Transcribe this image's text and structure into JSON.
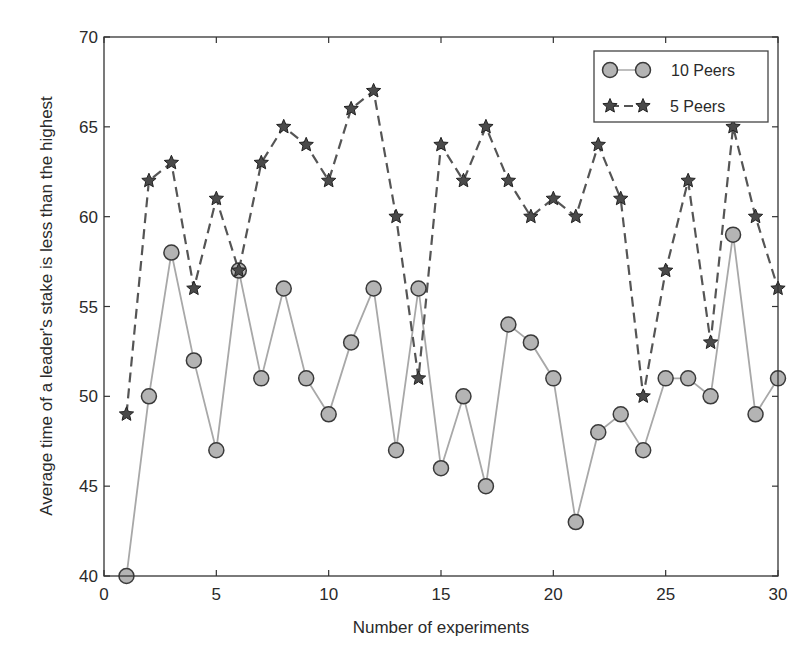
{
  "chart_data": {
    "type": "line",
    "title": "",
    "xlabel": "Number of experiments",
    "ylabel": "Average time of a leader's stake is less than the highest",
    "xlim": [
      0,
      30
    ],
    "ylim": [
      40,
      70
    ],
    "xticks": [
      0,
      5,
      10,
      15,
      20,
      25,
      30
    ],
    "yticks": [
      40,
      45,
      50,
      55,
      60,
      65,
      70
    ],
    "grid": false,
    "legend_position": "upper right",
    "x": [
      1,
      2,
      3,
      4,
      5,
      6,
      7,
      8,
      9,
      10,
      11,
      12,
      13,
      14,
      15,
      16,
      17,
      18,
      19,
      20,
      21,
      22,
      23,
      24,
      25,
      26,
      27,
      28,
      29,
      30
    ],
    "series": [
      {
        "name": "10 Peers",
        "marker": "circle",
        "line_style": "solid",
        "line_color": "#a8a8a8",
        "marker_fill": "#b4b4b4",
        "marker_edge": "#3a3a3a",
        "values": [
          40,
          50,
          58,
          52,
          47,
          57,
          51,
          56,
          51,
          49,
          53,
          56,
          47,
          56,
          46,
          50,
          45,
          54,
          53,
          51,
          43,
          48,
          49,
          47,
          51,
          51,
          50,
          59,
          49,
          51
        ]
      },
      {
        "name": "5 Peers",
        "marker": "star",
        "line_style": "dashed",
        "line_color": "#555555",
        "marker_fill": "#4a4a4a",
        "marker_edge": "#222222",
        "values": [
          49,
          62,
          63,
          56,
          61,
          57,
          63,
          65,
          64,
          62,
          66,
          67,
          60,
          51,
          64,
          62,
          65,
          62,
          60,
          61,
          60,
          64,
          61,
          50,
          57,
          62,
          53,
          65,
          60,
          56
        ]
      }
    ]
  }
}
